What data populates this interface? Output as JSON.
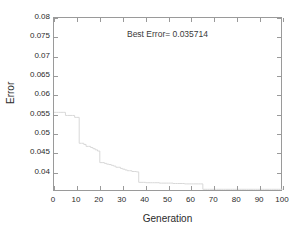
{
  "figure": {
    "background_color": "#ffffff",
    "frame_color": "#9a9a9a",
    "text_color": "#2b2b2b"
  },
  "annotation": {
    "text": "Best Error= 0.035714"
  },
  "chart_data": {
    "type": "line",
    "title": "",
    "subtitle": "",
    "xlabel": "Generation",
    "ylabel": "Error",
    "xlim": [
      0,
      100
    ],
    "ylim": [
      0.035,
      0.08
    ],
    "xticks": [
      0,
      10,
      20,
      30,
      40,
      50,
      60,
      70,
      80,
      90,
      100
    ],
    "xticklabels": [
      "0",
      "10",
      "20",
      "30",
      "40",
      "50",
      "60",
      "70",
      "80",
      "90",
      "100"
    ],
    "yticks": [
      0.04,
      0.045,
      0.05,
      0.055,
      0.06,
      0.065,
      0.07,
      0.075,
      0.08
    ],
    "yticklabels": [
      "0.04",
      "0.045",
      "0.05",
      "0.055",
      "0.06",
      "0.065",
      "0.07",
      "0.075",
      "0.08"
    ],
    "grid": false,
    "legend": null,
    "legend_position": "none",
    "annotations": [
      {
        "text": "Best Error= 0.035714",
        "x": 50,
        "y": 0.0745
      }
    ],
    "series": [
      {
        "name": "best error per generation",
        "color": "#d8d8d8",
        "line_width": 1,
        "x": [
          0,
          1,
          2,
          3,
          4,
          5,
          6,
          7,
          8,
          9,
          10,
          11,
          12,
          13,
          14,
          15,
          16,
          17,
          18,
          19,
          20,
          21,
          22,
          23,
          24,
          25,
          26,
          27,
          28,
          29,
          30,
          31,
          32,
          33,
          34,
          35,
          36,
          37,
          38,
          39,
          40,
          41,
          42,
          43,
          44,
          45,
          46,
          47,
          48,
          49,
          50,
          51,
          52,
          53,
          54,
          55,
          56,
          57,
          58,
          59,
          60,
          61,
          62,
          63,
          64,
          65,
          66,
          67,
          68,
          69,
          70,
          71,
          72,
          73,
          74,
          75,
          76,
          77,
          78,
          79,
          80,
          81,
          82,
          83,
          84,
          85,
          86,
          87,
          88,
          89,
          90,
          91,
          92,
          93,
          94,
          95,
          96,
          97,
          98,
          99,
          100
        ],
        "values": [
          0.0556,
          0.0556,
          0.0556,
          0.0556,
          0.0556,
          0.0548,
          0.0548,
          0.0548,
          0.0548,
          0.0543,
          0.0543,
          0.0476,
          0.0476,
          0.0473,
          0.0468,
          0.0468,
          0.0465,
          0.0462,
          0.0459,
          0.0456,
          0.0426,
          0.0426,
          0.0424,
          0.0422,
          0.0421,
          0.0419,
          0.0417,
          0.0414,
          0.0414,
          0.0411,
          0.0409,
          0.0407,
          0.0405,
          0.0405,
          0.0403,
          0.0403,
          0.0402,
          0.0375,
          0.0375,
          0.0375,
          0.0374,
          0.0374,
          0.0374,
          0.0374,
          0.0374,
          0.0374,
          0.0373,
          0.0373,
          0.0373,
          0.0373,
          0.0373,
          0.0373,
          0.0372,
          0.0372,
          0.0372,
          0.0372,
          0.0372,
          0.0371,
          0.0371,
          0.0371,
          0.0371,
          0.0371,
          0.0371,
          0.0371,
          0.0371,
          0.0357,
          0.0357,
          0.0357,
          0.0357,
          0.0357,
          0.0357,
          0.0357,
          0.0357,
          0.0357,
          0.0357,
          0.0357,
          0.0357,
          0.0357,
          0.0357,
          0.0357,
          0.0357,
          0.0357,
          0.0357,
          0.0357,
          0.0357,
          0.0357,
          0.0357,
          0.0357,
          0.0357,
          0.0357,
          0.0357,
          0.0357,
          0.0357,
          0.0357,
          0.0357,
          0.0357,
          0.0357,
          0.0357,
          0.0357,
          0.0357,
          0.0357
        ]
      }
    ]
  }
}
